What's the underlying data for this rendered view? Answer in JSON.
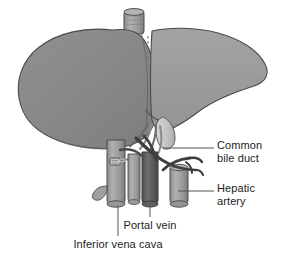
{
  "figure": {
    "background_color": "#ffffff",
    "width": 284,
    "height": 256
  },
  "colors": {
    "liver_right_lobe": "#8a8a8a",
    "liver_left_lobe": "#9b9b9b",
    "liver_outline": "#4a4a4a",
    "vessel_light": "#a6a6a6",
    "vessel_mid": "#8f8f8f",
    "vessel_dark": "#5a5a5a",
    "vessel_darkest": "#3d3d3d",
    "gallbladder": "#c9c9c9",
    "leader_line": "#555555",
    "text": "#1d1d1d"
  },
  "labels": [
    {
      "id": "common-bile-duct",
      "lines": "Common\nbile duct",
      "leader": {
        "type": "horizontal",
        "x1": 163,
        "y1": 148,
        "x2": 214,
        "y2": 148
      }
    },
    {
      "id": "hepatic-artery",
      "lines": "Hepatic\nartery",
      "leader": {
        "type": "horizontal",
        "x1": 178,
        "y1": 191,
        "x2": 214,
        "y2": 191
      }
    },
    {
      "id": "portal-vein",
      "lines": "Portal vein",
      "leader": {
        "type": "vertical",
        "x1": 150,
        "y1": 205,
        "x2": 150,
        "y2": 217
      }
    },
    {
      "id": "inferior-vena-cava",
      "lines": "Inferior vena cava",
      "leader": {
        "type": "vertical",
        "x1": 118,
        "y1": 202,
        "x2": 118,
        "y2": 236
      }
    }
  ],
  "anatomy_parts": [
    {
      "name": "inferior-vena-cava-superior-stub",
      "description": "Short cylinder at top of liver"
    },
    {
      "name": "liver-right-lobe",
      "description": "Large left-of-image lobe"
    },
    {
      "name": "liver-left-lobe",
      "description": "Lighter right-of-image lobe"
    },
    {
      "name": "falciform-fissure",
      "description": "Dashed vertical line between lobes"
    },
    {
      "name": "gallbladder",
      "description": "Pale pear-shaped body below liver"
    },
    {
      "name": "inferior-vena-cava-trunk",
      "description": "Wide vertical vessel column"
    },
    {
      "name": "portal-vein-trunk",
      "description": "Dark vertical vessel column"
    },
    {
      "name": "hepatic-artery-trunk",
      "description": "Right vertical vessel column with branches"
    },
    {
      "name": "common-bile-duct-vessel",
      "description": "Dark duct crossing diagonally"
    }
  ]
}
